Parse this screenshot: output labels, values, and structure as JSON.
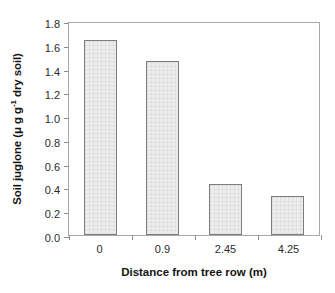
{
  "chart_data": {
    "type": "bar",
    "title": "",
    "categories": [
      "0",
      "0.9",
      "2.45",
      "4.25"
    ],
    "values": [
      1.64,
      1.46,
      0.43,
      0.33
    ],
    "xlabel": "Distance from tree row (m)",
    "ylabel_parts": {
      "prefix": "Soil juglone (",
      "mu": "μ",
      "unit_main": " g g",
      "exponent": "-1",
      "suffix": " dry soil)"
    },
    "ylabel_text": "Soil juglone (μ g g-1 dry soil)",
    "ylim": [
      0.0,
      1.8
    ],
    "yticks": [
      "0.0",
      "0.2",
      "0.4",
      "0.6",
      "0.8",
      "1.0",
      "1.2",
      "1.4",
      "1.6",
      "1.8"
    ],
    "ytick_values": [
      0.0,
      0.2,
      0.4,
      0.6,
      0.8,
      1.0,
      1.2,
      1.4,
      1.6,
      1.8
    ],
    "grid": false,
    "legend": null,
    "bar_fill_color": "#ededed",
    "bar_edge_color": "#7d7d7d",
    "axis_color": "#a8a8a8",
    "background_color": "#ffffff"
  }
}
